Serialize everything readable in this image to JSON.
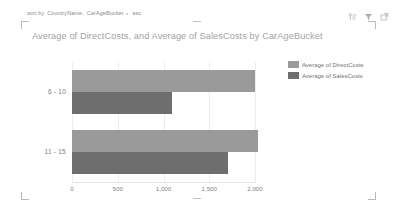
{
  "toolbar": {
    "sort_prefix": "sort by",
    "sort_field_1": "CountryName,",
    "sort_field_2": "CarAgeBucket",
    "sort_caret": "▾",
    "sort_direction": "asc",
    "icons": [
      {
        "name": "sort-icon",
        "title": "Sort"
      },
      {
        "name": "filter-icon",
        "title": "Filter"
      },
      {
        "name": "focus-mode-icon",
        "title": "Focus mode"
      }
    ]
  },
  "chart_data": {
    "type": "bar",
    "orientation": "horizontal",
    "title": "Average of DirectCosts, and Average of SalesCosts by CarAgeBucket",
    "xlabel": "",
    "ylabel": "",
    "categories": [
      "6 - 10",
      "11 - 15"
    ],
    "series": [
      {
        "name": "Average of DirectCosts",
        "color": "#9a9a9a",
        "values": [
          2000,
          2030
        ]
      },
      {
        "name": "Average of SalesCosts",
        "color": "#6e6e6e",
        "values": [
          1090,
          1700
        ]
      }
    ],
    "xlim": [
      0,
      2000
    ],
    "xticks": [
      0,
      500,
      1000,
      1500,
      2000
    ],
    "xtick_labels": [
      "0",
      "500",
      "1,000",
      "1,500",
      "2,000"
    ],
    "grid": true,
    "legend_position": "right"
  }
}
